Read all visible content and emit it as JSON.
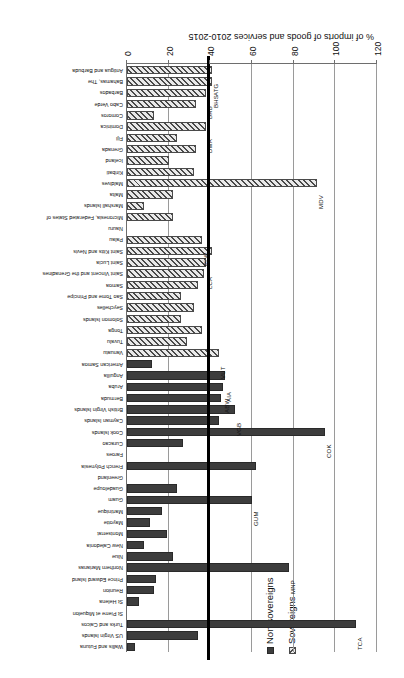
{
  "chart_data": {
    "type": "bar",
    "orientation": "horizontal",
    "title": "",
    "xlabel": "",
    "ylabel": "% of imports of goods and services 2010-2015",
    "ylim": [
      0,
      120
    ],
    "tick_values": [
      0,
      20,
      40,
      60,
      80,
      100,
      120
    ],
    "tick_labels": [
      "0",
      "20",
      "40",
      "60",
      "80",
      "100",
      "120"
    ],
    "grid": true,
    "reference_line": 40,
    "legend_position": "top-left",
    "series": [
      {
        "name": "Sovereigns",
        "pattern": "hatched",
        "color": "#e9e9e9"
      },
      {
        "name": "Non-sovereigns",
        "pattern": "solid",
        "color": "#3d3d3d"
      }
    ],
    "categories": [
      "Antigua and Barbuda",
      "Bahamas, The",
      "Barbados",
      "Cabo Verde",
      "Comoros",
      "Dominica",
      "Fiji",
      "Grenada",
      "Iceland",
      "Kiribati",
      "Maldives",
      "Malta",
      "Marshall Islands",
      "Micronesia, Federated States of",
      "Nauru",
      "Palau",
      "Saint Kitts and Nevis",
      "Saint Lucia",
      "Saint Vincent and the Grenadines",
      "Samoa",
      "Sao Tome and Principe",
      "Seychelles",
      "Solomon Islands",
      "Tonga",
      "Tuvalu",
      "Vanuatu",
      "American Samoa",
      "Anguilla",
      "Aruba",
      "Bermuda",
      "British Virgin Islands",
      "Cayman Islands",
      "Cook Islands",
      "Curacao",
      "Faroes",
      "French Polynesia",
      "Greenland",
      "Guadeloupe",
      "Guam",
      "Martinique",
      "Mayotte",
      "Montserrat",
      "New Caledonia",
      "Niue",
      "Northern Marianas",
      "Prince Edward Island",
      "Reunion",
      "St Helena",
      "St Pierre et Miquelon",
      "Turks and Caicos",
      "US Virgin Islands",
      "Wallis and Futuna"
    ],
    "values": [
      41,
      41,
      38,
      33,
      13,
      38,
      24,
      33,
      20,
      32,
      91,
      22,
      8,
      22,
      0,
      36,
      41,
      38,
      37,
      34,
      26,
      32,
      26,
      36,
      29,
      44,
      12,
      47,
      46,
      45,
      52,
      44,
      95,
      27,
      0,
      62,
      0,
      24,
      60,
      17,
      11,
      19,
      8,
      22,
      78,
      14,
      13,
      6,
      0,
      110,
      34,
      4
    ],
    "groups": [
      "Sovereigns",
      "Sovereigns",
      "Sovereigns",
      "Sovereigns",
      "Sovereigns",
      "Sovereigns",
      "Sovereigns",
      "Sovereigns",
      "Sovereigns",
      "Sovereigns",
      "Sovereigns",
      "Sovereigns",
      "Sovereigns",
      "Sovereigns",
      "Sovereigns",
      "Sovereigns",
      "Sovereigns",
      "Sovereigns",
      "Sovereigns",
      "Sovereigns",
      "Sovereigns",
      "Sovereigns",
      "Sovereigns",
      "Sovereigns",
      "Sovereigns",
      "Sovereigns",
      "Non-sovereigns",
      "Non-sovereigns",
      "Non-sovereigns",
      "Non-sovereigns",
      "Non-sovereigns",
      "Non-sovereigns",
      "Non-sovereigns",
      "Non-sovereigns",
      "Non-sovereigns",
      "Non-sovereigns",
      "Non-sovereigns",
      "Non-sovereigns",
      "Non-sovereigns",
      "Non-sovereigns",
      "Non-sovereigns",
      "Non-sovereigns",
      "Non-sovereigns",
      "Non-sovereigns",
      "Non-sovereigns",
      "Non-sovereigns",
      "Non-sovereigns",
      "Non-sovereigns",
      "Non-sovereigns",
      "Non-sovereigns",
      "Non-sovereigns",
      "Non-sovereigns"
    ],
    "annotations": [
      {
        "code": "ATG",
        "category": "Antigua and Barbuda",
        "value": 41
      },
      {
        "code": "BHS",
        "category": "Bahamas, The",
        "value": 41
      },
      {
        "code": "BRB",
        "category": "Barbados",
        "value": 38
      },
      {
        "code": "DMA",
        "category": "Dominica",
        "value": 38
      },
      {
        "code": "MDV",
        "category": "Maldives",
        "value": 91
      },
      {
        "code": "PLW",
        "category": "Palau",
        "value": 36
      },
      {
        "code": "LCA",
        "category": "Saint Lucia",
        "value": 38
      },
      {
        "code": "VUT",
        "category": "Vanuatu",
        "value": 44
      },
      {
        "code": "AIA",
        "category": "Anguilla",
        "value": 47
      },
      {
        "code": "ABW",
        "category": "Aruba",
        "value": 46
      },
      {
        "code": "VGB",
        "category": "British Virgin Islands",
        "value": 52
      },
      {
        "code": "COK",
        "category": "Cook Islands",
        "value": 95
      },
      {
        "code": "GUM",
        "category": "Guam",
        "value": 60
      },
      {
        "code": "MNP",
        "category": "Northern Marianas",
        "value": 78
      },
      {
        "code": "TCA",
        "category": "Turks and Caicos",
        "value": 110
      }
    ]
  },
  "legend": {
    "sovereigns_label": "Sovereigns",
    "non_sovereigns_label": "Non-sovereigns"
  },
  "axis": {
    "title": "% of imports of goods and services 2010-2015"
  }
}
